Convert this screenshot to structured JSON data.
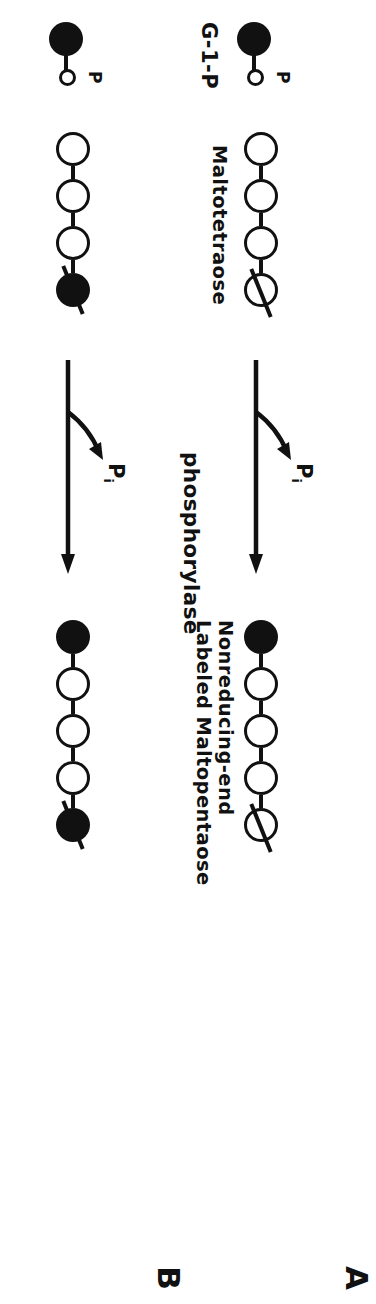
{
  "figure": {
    "type": "reaction-scheme",
    "enzyme_label": "phosphorylase",
    "colors": {
      "ink": "#111111",
      "background": "#ffffff",
      "unlabeled_residue_fill": "#ffffff",
      "labeled_residue_fill": "#111111"
    },
    "symbols": {
      "open_circle_meaning": "unlabeled glucosyl residue",
      "filled_circle_meaning": "labeled glucosyl residue",
      "slash_meaning": "nonreducing end marker"
    }
  },
  "panels": [
    {
      "letter": "A",
      "substrate_donor": {
        "label": "G-1-P",
        "phosphate_label": "P",
        "residues": [
          "filled"
        ],
        "has_phosphate": true
      },
      "substrate_acceptor": {
        "label": "Maltotetraose",
        "residues": [
          "open",
          "open",
          "open",
          "open"
        ],
        "nonreducing_end_slash": true,
        "count": 4
      },
      "arrow": {
        "enzyme": "phosphorylase",
        "leaving_group": "P",
        "leaving_group_subscript": "i",
        "direction": "right"
      },
      "product": {
        "label": "Nonreducing-end\nLabeled Maltopentaose",
        "label_line1": "Nonreducing-end",
        "label_line2": "Labeled Maltopentaose",
        "residues": [
          "filled",
          "open",
          "open",
          "open",
          "open"
        ],
        "nonreducing_end_slash": true,
        "count": 5
      }
    },
    {
      "letter": "B",
      "substrate_donor": {
        "label": "G-1-P",
        "phosphate_label": "P",
        "residues": [
          "filled"
        ],
        "has_phosphate": true
      },
      "substrate_acceptor": {
        "label": "",
        "residues": [
          "open",
          "open",
          "open",
          "filled"
        ],
        "nonreducing_end_slash": true,
        "count": 4
      },
      "arrow": {
        "enzyme": "phosphorylase",
        "leaving_group": "P",
        "leaving_group_subscript": "i",
        "direction": "right"
      },
      "product": {
        "label": "",
        "residues": [
          "filled",
          "open",
          "open",
          "open",
          "filled"
        ],
        "nonreducing_end_slash": true,
        "count": 5
      }
    }
  ]
}
